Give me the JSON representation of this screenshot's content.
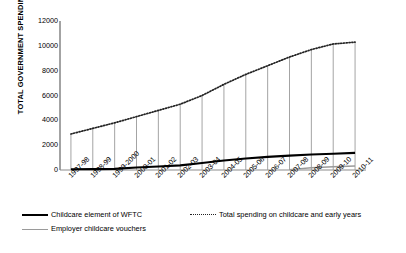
{
  "chart_data": {
    "type": "line",
    "title": "",
    "xlabel": "",
    "ylabel": "TOTAL GOVERNMENT SPENDING",
    "ylim": [
      0,
      12000
    ],
    "ytick_values": [
      0,
      2000,
      4000,
      6000,
      8000,
      10000,
      12000
    ],
    "ytick_labels": [
      "0",
      "2000",
      "4000",
      "6000",
      "8000",
      "10000",
      "12000"
    ],
    "grid": false,
    "legend_position": "bottom",
    "categories": [
      "1997-98",
      "1998-99",
      "1999-2000",
      "2000-01",
      "2001-02",
      "2002-03",
      "2003-04",
      "2004-05",
      "2005-06",
      "2006-07",
      "2007-08",
      "2008-09",
      "2009-10",
      "2010-11"
    ],
    "series": [
      {
        "name": "Total spending on childcare and early years",
        "style": "dotted",
        "color": "#222222",
        "values": [
          2900,
          3350,
          3800,
          4300,
          4800,
          5300,
          6000,
          6900,
          7700,
          8400,
          9100,
          9700,
          10150,
          10300
        ]
      },
      {
        "name": "Childcare element of WFTC",
        "style": "solid-thick",
        "color": "#000000",
        "values": [
          60,
          70,
          90,
          200,
          280,
          370,
          560,
          760,
          920,
          1060,
          1160,
          1250,
          1310,
          1380
        ]
      },
      {
        "name": "Employer childcare vouchers",
        "style": "solid-thin",
        "color": "#9a9a9a",
        "values": [
          null,
          null,
          null,
          null,
          null,
          null,
          null,
          null,
          null,
          null,
          30,
          180,
          260,
          330
        ]
      }
    ],
    "dropline_note": "vertical grey droplines from total-spending points to baseline"
  },
  "legend": {
    "items": [
      {
        "label": "Childcare element of WFTC",
        "style": "solid-thick"
      },
      {
        "label": "Total spending on childcare and early years",
        "style": "dotted"
      },
      {
        "label": "Employer childcare vouchers",
        "style": "solid-thin"
      }
    ]
  },
  "colors": {
    "axis": "#8c8c8c",
    "total_line": "#222222",
    "wftc_line": "#000000",
    "voucher_line": "#9a9a9a",
    "dropline": "#9a9a9a",
    "background": "#ffffff"
  }
}
